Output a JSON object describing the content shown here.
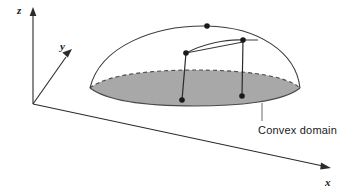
{
  "figure": {
    "title": "",
    "axes": {
      "z": {
        "label": "z",
        "direction": "up"
      },
      "y": {
        "label": "y",
        "direction": "up-right-oblique"
      },
      "x": {
        "label": "x",
        "direction": "down-right"
      }
    },
    "annotations": {
      "convex_domain": "Convex domain"
    },
    "colors": {
      "domain_fill": "#a8a8a8",
      "domain_edge": "#4a4a4a",
      "axis": "#2b2b2b",
      "curve": "#3a3a3a",
      "label_text": "#1a1a1a",
      "leader": "#6a6a6a",
      "background": "#ffffff"
    },
    "geometry": {
      "origin": {
        "x": 33,
        "y": 104
      },
      "z_axis_tip": {
        "x": 33,
        "y": 10
      },
      "y_axis_tip": {
        "x": 71,
        "y": 52
      },
      "x_axis_tip": {
        "x": 330,
        "y": 169
      },
      "domain_ellipse": {
        "center_x": 195,
        "center_y": 88,
        "radius_x": 105,
        "radius_y": 18
      },
      "dome_apex": {
        "x": 207,
        "y": 26
      },
      "surface_points": [
        {
          "x": 186,
          "y": 53
        },
        {
          "x": 243,
          "y": 40
        }
      ],
      "base_points": [
        {
          "x": 182,
          "y": 100
        },
        {
          "x": 242,
          "y": 96
        }
      ],
      "leader": {
        "x": 262,
        "y_top": 103,
        "y_bottom": 121
      },
      "label_position": {
        "x": 258,
        "y": 134
      }
    }
  }
}
